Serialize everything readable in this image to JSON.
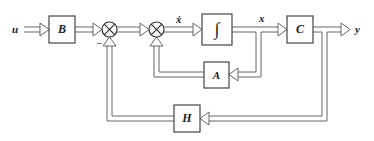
{
  "diagram": {
    "type": "state-space block diagram with output feedback",
    "colors": {
      "line": "#555555",
      "box_border": "#444444",
      "text": "#222222",
      "background": "#ffffff"
    },
    "signals": {
      "input": "u",
      "state_derivative": "ẋ",
      "state": "x",
      "output": "y",
      "minus_sign": "−"
    },
    "blocks": {
      "B": "B",
      "integrator": "∫",
      "C": "C",
      "A": "A",
      "H": "H"
    },
    "summing_junctions": [
      {
        "id": "sum1",
        "symbol": "⊗",
        "signs": [
          "+",
          "−"
        ]
      },
      {
        "id": "sum2",
        "symbol": "⊗",
        "signs": [
          "+",
          "+"
        ]
      }
    ],
    "connections": [
      "u → B",
      "B → sum1",
      "sum1 → sum2",
      "sum2 → ∫ (ẋ)",
      "∫ → C (x)",
      "C → y",
      "x → A",
      "A → sum2",
      "y → H",
      "H → sum1 (−)"
    ]
  }
}
